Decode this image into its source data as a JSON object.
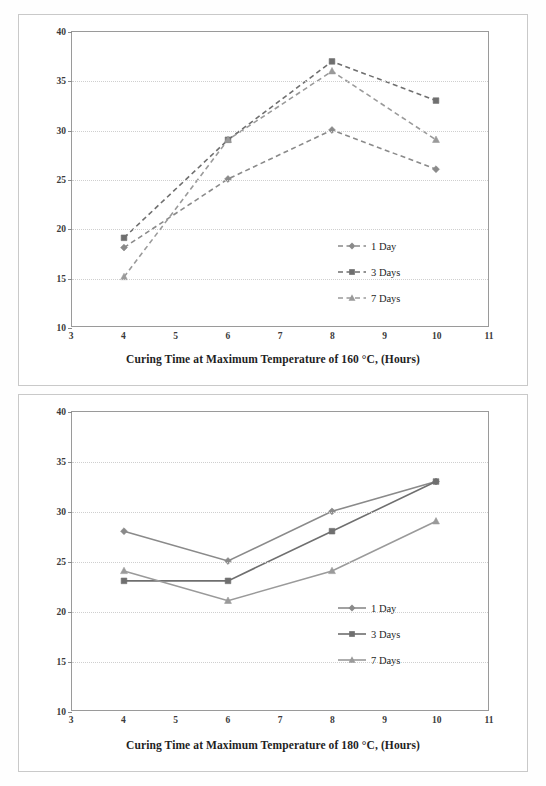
{
  "page": {
    "background": "#fefefe",
    "panel_border_color": "#c9c9c9"
  },
  "colors": {
    "series_1day": "#8a8a8a",
    "series_3days": "#6f6f6f",
    "series_7days": "#9a9a9a",
    "axis": "#8a8a8a",
    "grid": "#cfcfcf",
    "text": "#1f1f1f"
  },
  "chart_data": [
    {
      "id": "chart-160c",
      "type": "line",
      "title": "",
      "xlabel": "Curing Time at Maximum Temperature of 160 °C, (Hours)",
      "ylabel": "Compressive Strength (ksc)",
      "x": [
        4,
        6,
        8,
        10
      ],
      "xlim": [
        3,
        11
      ],
      "ylim": [
        10,
        40
      ],
      "xticks": [
        3,
        4,
        5,
        6,
        7,
        8,
        9,
        10,
        11
      ],
      "xtick_labels": [
        "3",
        "4",
        "5",
        "6",
        "7",
        "8",
        "9",
        "10",
        "11"
      ],
      "yticks": [
        10,
        15,
        20,
        25,
        30,
        35,
        40
      ],
      "ytick_labels": [
        "10",
        "15",
        "20",
        "25",
        "30",
        "35",
        "40"
      ],
      "grid": true,
      "linestyle": "dashed",
      "legend_position": "inside-right-lower",
      "series": [
        {
          "name": "1 Day",
          "marker": "diamond",
          "color": "#8a8a8a",
          "values": [
            18,
            25,
            30,
            26
          ]
        },
        {
          "name": "3 Days",
          "marker": "square",
          "color": "#6f6f6f",
          "values": [
            19,
            29,
            37,
            33
          ]
        },
        {
          "name": "7 Days",
          "marker": "triangle",
          "color": "#9a9a9a",
          "values": [
            15,
            29,
            36,
            29
          ]
        }
      ]
    },
    {
      "id": "chart-180c",
      "type": "line",
      "title": "",
      "xlabel": "Curing Time at Maximum Temperature of 180 °C, (Hours)",
      "ylabel": "Compressive Strength (ksc)",
      "x": [
        4,
        6,
        8,
        10
      ],
      "xlim": [
        3,
        11
      ],
      "ylim": [
        10,
        40
      ],
      "xticks": [
        3,
        4,
        5,
        6,
        7,
        8,
        9,
        10,
        11
      ],
      "xtick_labels": [
        "3",
        "4",
        "5",
        "6",
        "7",
        "8",
        "9",
        "10",
        "11"
      ],
      "yticks": [
        10,
        15,
        20,
        25,
        30,
        35,
        40
      ],
      "ytick_labels": [
        "10",
        "15",
        "20",
        "25",
        "30",
        "35",
        "40"
      ],
      "grid": true,
      "linestyle": "solid",
      "legend_position": "inside-right-lower",
      "series": [
        {
          "name": "1 Day",
          "marker": "diamond",
          "color": "#8a8a8a",
          "values": [
            28,
            25,
            30,
            33
          ]
        },
        {
          "name": "3 Days",
          "marker": "square",
          "color": "#6f6f6f",
          "values": [
            23,
            23,
            28,
            33
          ]
        },
        {
          "name": "7 Days",
          "marker": "triangle",
          "color": "#9a9a9a",
          "values": [
            24,
            21,
            24,
            29
          ]
        }
      ]
    }
  ]
}
